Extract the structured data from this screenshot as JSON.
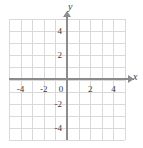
{
  "chart_data": {
    "type": "scatter",
    "title": "",
    "subtitle": "",
    "xlabel": "x",
    "ylabel": "y",
    "xlim": [
      -5,
      5
    ],
    "ylim": [
      -5,
      5
    ],
    "grid": true,
    "grid_step": 1,
    "legend": null,
    "series": [],
    "values": [],
    "x": [],
    "categories": [],
    "annotations": [],
    "x_tick_labels": [
      "-4",
      "-2",
      "0",
      "2",
      "4"
    ],
    "x_tick_values": [
      -4,
      -2,
      0,
      2,
      4
    ],
    "y_tick_labels": [
      "4",
      "2",
      "-2",
      "-4"
    ],
    "y_tick_values": [
      4,
      2,
      -2,
      -4
    ],
    "origin_label": "0",
    "axis_color": "#8c8c8c",
    "grid_color": "#d9d9d9",
    "text_color": "#3a3a3a",
    "background_color": "#ffffff"
  },
  "axes": {
    "x_axis_name": "x",
    "y_axis_name": "y"
  },
  "ticks": {
    "x": [
      {
        "label": "-4",
        "value": -4
      },
      {
        "label": "-2",
        "value": -2
      },
      {
        "label": "0",
        "value": 0
      },
      {
        "label": "2",
        "value": 2
      },
      {
        "label": "4",
        "value": 4
      }
    ],
    "y": [
      {
        "label": "4",
        "value": 4
      },
      {
        "label": "2",
        "value": 2
      },
      {
        "label": "-2",
        "value": -2
      },
      {
        "label": "-4",
        "value": -4
      }
    ]
  }
}
